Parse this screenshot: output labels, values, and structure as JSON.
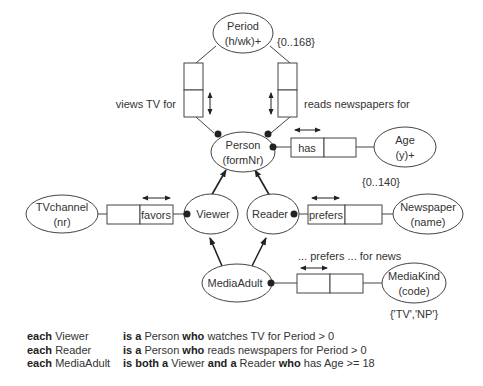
{
  "entities": {
    "period": {
      "name": "Period",
      "ref": "(h/wk)+",
      "constraint": "{0..168}"
    },
    "person": {
      "name": "Person",
      "ref": "(formNr)"
    },
    "age": {
      "name": "Age",
      "ref": "(y)+",
      "constraint": "{0..140}"
    },
    "tvchannel": {
      "name": "TVchannel",
      "ref": "(nr)"
    },
    "viewer": {
      "name": "Viewer"
    },
    "reader": {
      "name": "Reader"
    },
    "newspaper": {
      "name": "Newspaper",
      "ref": "(name)"
    },
    "mediaadult": {
      "name": "MediaAdult"
    },
    "mediakind": {
      "name": "MediaKind",
      "ref": "(code)",
      "constraint": "{'TV','NP'}"
    }
  },
  "fact_types": {
    "views_tv": {
      "reading": "views TV for"
    },
    "reads_news": {
      "reading": "reads newspapers for"
    },
    "has_age": {
      "reading": "has"
    },
    "favors": {
      "reading": "favors"
    },
    "prefers": {
      "reading": "prefers"
    },
    "prefers_news": {
      "reading": "... prefers ... for news"
    }
  },
  "rules": [
    {
      "kw1": "each",
      "subject": "Viewer",
      "kw2": "is a",
      "t1": " Person ",
      "kw3": "who",
      "t2": " watches TV for Period > 0",
      "kw4": "",
      "t3": "",
      "kw5": "",
      "t4": ""
    },
    {
      "kw1": "each",
      "subject": "Reader",
      "kw2": "is a",
      "t1": " Person ",
      "kw3": "who",
      "t2": " reads newspapers for Period > 0",
      "kw4": "",
      "t3": "",
      "kw5": "",
      "t4": ""
    },
    {
      "kw1": "each",
      "subject": "MediaAdult",
      "kw2": "is both a",
      "t1": " Viewer ",
      "kw3": "and a",
      "t2": " Reader ",
      "kw4": "who",
      "t3": " has Age >= 18",
      "kw5": "",
      "t4": ""
    }
  ],
  "colors": {
    "stroke": "#333333",
    "text": "#333333",
    "background": "#ffffff"
  }
}
